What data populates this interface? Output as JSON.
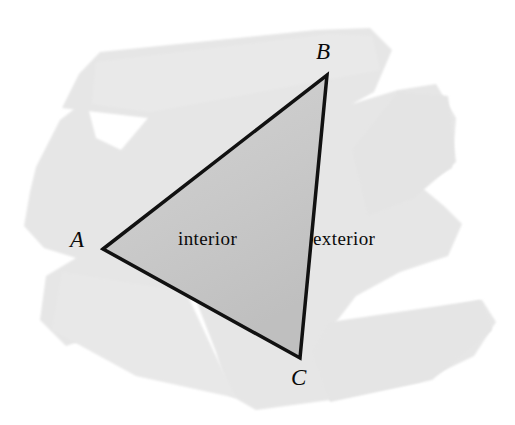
{
  "figure": {
    "background_color": "#ffffff",
    "brush_color": "#e6e6e6",
    "interior_fill_color": "#c9c9c9",
    "outline_color": "#111111",
    "text_color": "#0a0a0a"
  },
  "vertices": [
    {
      "name": "A",
      "label": "A",
      "x": 103,
      "y": 249
    },
    {
      "name": "B",
      "label": "B",
      "x": 327,
      "y": 75
    },
    {
      "name": "C",
      "label": "C",
      "x": 300,
      "y": 358
    }
  ],
  "regions": [
    {
      "name": "interior",
      "label": "interior",
      "x": 178,
      "y": 229
    },
    {
      "name": "exterior",
      "label": "exterior",
      "x": 313,
      "y": 229
    }
  ],
  "geometry": {
    "triangle_path": "M 103,249 L 327,75 L 300,358 Z",
    "outline_width_px": 3.5,
    "brush_path": "M 36,167 L 60,120 L 86,100 L 96,138 L 121,150 L 148,118 L 62,108 L 79,74 L 100,52 L 316,30 L 370,28 L 392,50 L 374,92 L 352,104 L 398,90 L 436,84 L 456,118 L 452,168 L 420,186 L 444,206 L 462,224 L 448,256 L 400,272 L 356,296 L 330,330 L 482,300 L 496,322 L 474,356 L 420,382 L 330,400 L 256,410 L 228,394 L 216,352 L 196,300 L 168,296 L 112,330 L 66,346 L 40,320 L 46,276 L 76,258 L 44,248 L 24,226 L 30,192 Z"
  }
}
